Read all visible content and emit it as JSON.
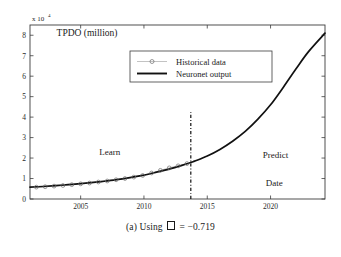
{
  "figure": {
    "caption_prefix": "(a) Using",
    "caption_symbol": "missing-glyph-box",
    "caption_suffix": "= −0.719",
    "caption_full": "(a) Using □ = −0.719"
  },
  "chart_data": {
    "type": "line",
    "title": "",
    "xlabel": "Date",
    "ylabel": "TPDO (million)",
    "y_axis_multiplier": "x 10",
    "y_axis_exponent": "4",
    "xlim": [
      2001.0,
      2024.3
    ],
    "ylim": [
      0,
      8.5
    ],
    "xticks": [
      2005,
      2010,
      2015,
      2020
    ],
    "xtick_labels": [
      "2005",
      "2010",
      "2015",
      "2020"
    ],
    "yticks": [
      0,
      1,
      2,
      3,
      4,
      5,
      6,
      7,
      8
    ],
    "ytick_labels": [
      "0",
      "1",
      "2",
      "3",
      "4",
      "5",
      "6",
      "7",
      "8"
    ],
    "grid": false,
    "legend_position": "upper-center",
    "legend": [
      {
        "label": "Historical data",
        "marker": "circle",
        "style": "markers-with-thin-line",
        "color": "#8d8d8d"
      },
      {
        "label": "Neuronet output",
        "marker": "none",
        "style": "solid-line",
        "color": "#111111"
      }
    ],
    "annotations": [
      {
        "name": "learn-region-label",
        "text": "Learn",
        "x": 2007.3,
        "y": 2.15
      },
      {
        "name": "predict-region-label",
        "text": "Predict",
        "x": 2020.4,
        "y": 2.0
      },
      {
        "name": "date-axis-label",
        "text": "Date",
        "x": 2020.3,
        "y": 0.65
      },
      {
        "name": "y-axis-series-label",
        "text": "TPDO (million)",
        "x": 2003.1,
        "y": 7.95
      }
    ],
    "divider": {
      "name": "learn-predict-divider",
      "x": 2013.7,
      "y_from": 0,
      "y_to": 4.35,
      "style": "dash-dot",
      "label": "2013.7"
    },
    "series": [
      {
        "name": "Historical data",
        "x": [
          2001.5,
          2002.2,
          2002.9,
          2003.6,
          2004.3,
          2005.0,
          2005.7,
          2006.4,
          2007.1,
          2007.8,
          2008.5,
          2009.2,
          2009.9,
          2010.6,
          2011.3,
          2012.0,
          2012.7,
          2013.4
        ],
        "y": [
          0.58,
          0.6,
          0.63,
          0.66,
          0.7,
          0.74,
          0.78,
          0.83,
          0.88,
          0.94,
          1.0,
          1.07,
          1.15,
          1.27,
          1.4,
          1.52,
          1.62,
          1.73
        ]
      },
      {
        "name": "Neuronet output",
        "x": [
          2001.0,
          2002.0,
          2003.0,
          2004.0,
          2005.0,
          2006.0,
          2007.0,
          2008.0,
          2009.0,
          2010.0,
          2011.0,
          2012.0,
          2013.0,
          2013.7,
          2014.0,
          2015.0,
          2016.0,
          2017.0,
          2018.0,
          2019.0,
          2020.0,
          2021.0,
          2022.0,
          2023.0,
          2024.3
        ],
        "y": [
          0.58,
          0.61,
          0.65,
          0.7,
          0.75,
          0.81,
          0.88,
          0.96,
          1.06,
          1.17,
          1.31,
          1.46,
          1.64,
          1.78,
          1.85,
          2.1,
          2.42,
          2.82,
          3.3,
          3.9,
          4.6,
          5.45,
          6.35,
          7.2,
          8.1
        ]
      }
    ]
  }
}
